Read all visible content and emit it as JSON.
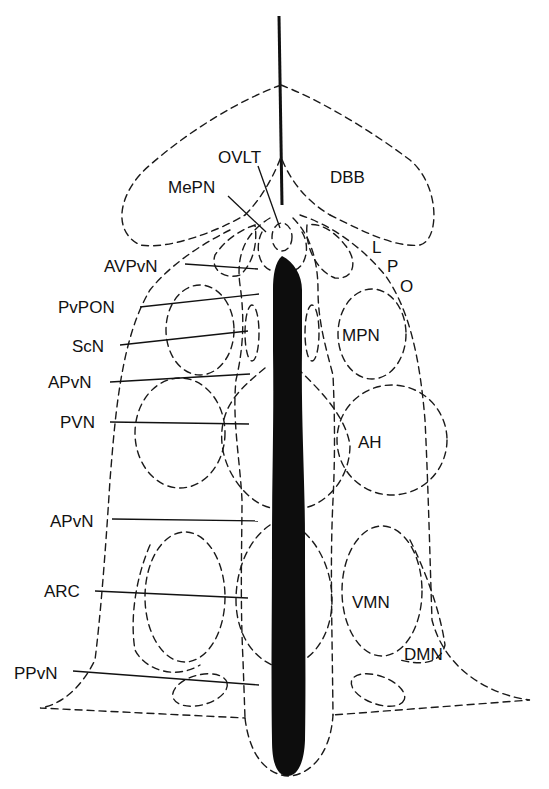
{
  "diagram": {
    "type": "hypothalamus coronal/midline schematic",
    "colors": {
      "ink": "#111111",
      "background": "#ffffff",
      "ventricle": "#0d0d0d"
    },
    "labels": {
      "ovlt": "OVLT",
      "mepn": "MePN",
      "dbb": "DBB",
      "lpo_l": "L",
      "lpo_p": "P",
      "lpo_o": "O",
      "avpvn": "AVPvN",
      "pvpon": "PvPON",
      "scn": "ScN",
      "apvn_upper": "APvN",
      "pvn": "PVN",
      "mpn": "MPN",
      "ah": "AH",
      "apvn_lower": "APvN",
      "arc": "ARC",
      "vmn": "VMN",
      "dmn": "DMN",
      "ppvn": "PPvN"
    },
    "regions": [
      "OVLT",
      "MePN",
      "DBB",
      "LPO",
      "AVPvN",
      "PvPON",
      "ScN",
      "APvN",
      "PVN",
      "MPN",
      "AH",
      "ARC",
      "VMN",
      "DMN",
      "PPvN"
    ]
  }
}
